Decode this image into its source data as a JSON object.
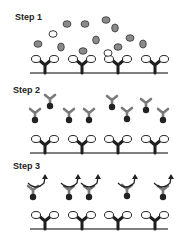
{
  "steps": [
    {
      "label": "Step 1"
    },
    {
      "label": "Step 2"
    },
    {
      "label": "Step 3"
    }
  ],
  "colors": {
    "antigen_gray": "#8a8a8a",
    "open_circle": "#ffffff",
    "capture_antibody": "#1e1e1e",
    "detection_antibody": "#7a7a7a",
    "label_dot": "#222222",
    "baseline": "#555555"
  },
  "icons": [
    "capture-antibody-icon",
    "antigen-icon",
    "detection-antibody-icon",
    "rotate-arrow-icon"
  ]
}
